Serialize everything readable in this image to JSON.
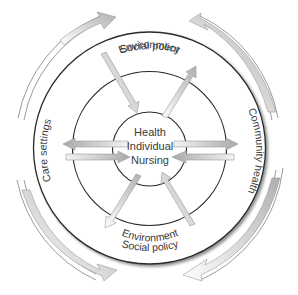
{
  "diagram": {
    "type": "concentric-circles",
    "center": {
      "lines": [
        "Health",
        "Individual",
        "Nursing"
      ]
    },
    "rings": {
      "inner": {
        "label_top": "",
        "label_bottom": ""
      },
      "middle": {
        "label_top": "Environment",
        "label_bottom": "Environment"
      },
      "outer": {
        "label_top": "Social policy",
        "label_bottom": "Social policy",
        "label_left": "Care settings",
        "label_right": "Community health"
      }
    },
    "colors": {
      "line": "#2a2a2a",
      "arrow_fill_light": "#f2f2f2",
      "arrow_fill_dark": "#a8a8a8",
      "text": "#3a3a3a"
    },
    "outer_arrows": [
      {
        "position": "top-left",
        "direction": "clockwise"
      },
      {
        "position": "top-right",
        "direction": "counter-clockwise"
      },
      {
        "position": "bottom-left",
        "direction": "counter-clockwise"
      },
      {
        "position": "bottom-right",
        "direction": "clockwise"
      }
    ],
    "radial_arrows": [
      {
        "from": "outer-top-left",
        "to": "center",
        "direction": "inward"
      },
      {
        "from": "center",
        "to": "outer-top-right",
        "direction": "outward"
      },
      {
        "from": "center",
        "to": "outer-left",
        "direction": "outward"
      },
      {
        "from": "outer-left",
        "to": "center",
        "direction": "inward"
      },
      {
        "from": "center",
        "to": "outer-right",
        "direction": "outward"
      },
      {
        "from": "outer-right",
        "to": "center",
        "direction": "inward"
      },
      {
        "from": "center",
        "to": "outer-bottom-left",
        "direction": "outward"
      },
      {
        "from": "outer-bottom-right",
        "to": "center",
        "direction": "inward"
      }
    ]
  }
}
